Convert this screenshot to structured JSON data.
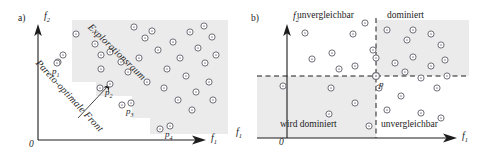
{
  "figure": {
    "background": "#ffffff",
    "ink": "#1c1c1c",
    "shade_color": "#ebebeb",
    "marker_stroke": "#6e6e78",
    "marker_fill": "#ffffff",
    "marker_core": "#8a8a94"
  },
  "panel_a": {
    "tag": "a)",
    "origin_label": "0",
    "y_axis_label": "f",
    "y_axis_sub": "2",
    "x_axis_label": "f",
    "x_axis_sub": "1",
    "front_label": "Pareto-optimale Front",
    "space_label": "Explorationsraum",
    "point_labels": [
      {
        "name": "p",
        "sub": "1",
        "x": 52,
        "y": 70
      },
      {
        "name": "p",
        "sub": "2",
        "x": 102,
        "y": 97
      },
      {
        "name": "p",
        "sub": "3",
        "x": 126,
        "y": 114
      },
      {
        "name": "p",
        "sub": "4",
        "x": 166,
        "y": 138
      }
    ],
    "points": [
      [
        58,
        62
      ],
      [
        76,
        34
      ],
      [
        95,
        44
      ],
      [
        101,
        55
      ],
      [
        110,
        52
      ],
      [
        121,
        62
      ],
      [
        101,
        69
      ],
      [
        134,
        27
      ],
      [
        128,
        72
      ],
      [
        145,
        38
      ],
      [
        139,
        58
      ],
      [
        147,
        82
      ],
      [
        158,
        50
      ],
      [
        152,
        31
      ],
      [
        167,
        69
      ],
      [
        173,
        42
      ],
      [
        180,
        58
      ],
      [
        164,
        88
      ],
      [
        190,
        32
      ],
      [
        186,
        76
      ],
      [
        198,
        48
      ],
      [
        205,
        63
      ],
      [
        196,
        92
      ],
      [
        209,
        82
      ],
      [
        212,
        37
      ],
      [
        216,
        55
      ],
      [
        204,
        26
      ],
      [
        178,
        100
      ],
      [
        192,
        110
      ],
      [
        213,
        100
      ],
      [
        100,
        88
      ],
      [
        122,
        105
      ],
      [
        160,
        129
      ],
      [
        63,
        55
      ]
    ],
    "front_curve": [
      [
        47,
        62
      ],
      [
        62,
        80
      ],
      [
        80,
        97
      ],
      [
        100,
        113
      ],
      [
        124,
        126
      ]
    ]
  },
  "panel_b": {
    "tag": "b)",
    "origin_label": "0",
    "y_axis_label": "f",
    "y_axis_sub": "2",
    "x_axis_label": "f",
    "x_axis_sub": "1",
    "x_axis_label_left": "f",
    "x_axis_sub_left": "1",
    "point_label": "p",
    "quadrants": [
      {
        "key": "top_left",
        "label": "unvergleichbar"
      },
      {
        "key": "top_right",
        "label": "dominiert"
      },
      {
        "key": "bottom_left",
        "label": "wird dominiert"
      },
      {
        "key": "bottom_right",
        "label": "unvergleichbar"
      }
    ],
    "p_point": [
      141,
      76
    ],
    "points": [
      [
        48,
        86
      ],
      [
        77,
        59
      ],
      [
        97,
        53
      ],
      [
        70,
        33
      ],
      [
        96,
        88
      ],
      [
        118,
        34
      ],
      [
        104,
        69
      ],
      [
        130,
        23
      ],
      [
        138,
        50
      ],
      [
        144,
        88
      ],
      [
        160,
        63
      ],
      [
        170,
        72
      ],
      [
        178,
        57
      ],
      [
        186,
        78
      ],
      [
        196,
        34
      ],
      [
        178,
        30
      ],
      [
        206,
        45
      ],
      [
        202,
        88
      ],
      [
        210,
        60
      ],
      [
        166,
        96
      ],
      [
        186,
        113
      ],
      [
        206,
        118
      ],
      [
        152,
        110
      ],
      [
        134,
        126
      ],
      [
        120,
        103
      ],
      [
        94,
        114
      ],
      [
        196,
        66
      ],
      [
        152,
        30
      ],
      [
        120,
        66
      ],
      [
        172,
        40
      ],
      [
        212,
        76
      ],
      [
        141,
        58
      ]
    ]
  }
}
